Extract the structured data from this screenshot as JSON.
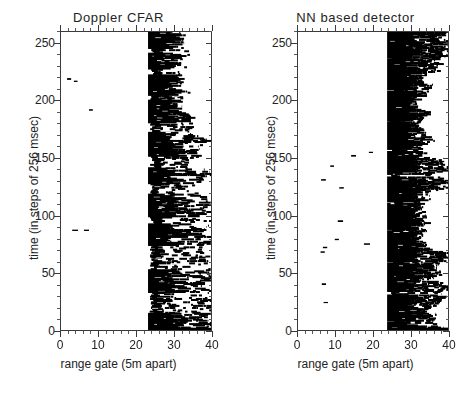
{
  "figure": {
    "background_color": "#ffffff",
    "ink_color": "#000000",
    "axis_color": "#3a3a3a",
    "panel_count": 2
  },
  "chart_data": {
    "type": "heatmap",
    "colormap": "binary (black = detection, white = no detection)",
    "xlabel": "range gate (5m apart)",
    "ylabel": "time (in steps of 256 msec)",
    "xlim": [
      0,
      40
    ],
    "ylim": [
      0,
      260
    ],
    "xticks": [
      0,
      10,
      20,
      30,
      40
    ],
    "xticklabels": [
      "0",
      "10",
      "20",
      "30",
      "40"
    ],
    "x_minor_tick_step": 2,
    "yticks": [
      0,
      50,
      100,
      150,
      200,
      250
    ],
    "yticklabels": [
      "0",
      "50",
      "100",
      "150",
      "200",
      "250"
    ],
    "y_minor_tick_step": 10,
    "grid": false,
    "legend": null,
    "panels": [
      {
        "index": 0,
        "title": "Doppler CFAR",
        "clutter_onset_gate": 23.2,
        "clutter_fill_fraction": 0.55,
        "clutter_texture": "striated horizontal streaks with ragged right edge",
        "false_alarm_count": 4,
        "false_alarms": [
          {
            "range_gate": 1.6,
            "time": 219,
            "width_gates": 1.1
          },
          {
            "range_gate": 3.4,
            "time": 217,
            "width_gates": 1.0
          },
          {
            "range_gate": 7.5,
            "time": 192,
            "width_gates": 1.0
          },
          {
            "range_gate": 3.0,
            "time": 87,
            "width_gates": 1.6
          },
          {
            "range_gate": 6.1,
            "time": 87,
            "width_gates": 1.4
          }
        ],
        "dense_time_bands": [
          [
            246,
            261
          ],
          [
            228,
            241
          ],
          [
            205,
            222
          ],
          [
            181,
            200
          ],
          [
            152,
            172
          ],
          [
            128,
            141
          ],
          [
            99,
            118
          ],
          [
            74,
            92
          ],
          [
            33,
            52
          ],
          [
            0,
            14
          ]
        ]
      },
      {
        "index": 1,
        "title": "NN based detector",
        "clutter_onset_gate": 23.8,
        "clutter_fill_fraction": 0.8,
        "clutter_texture": "solid contiguous block with ragged right edge",
        "false_alarm_count": 14,
        "false_alarms": [
          {
            "range_gate": 6.2,
            "time": 131,
            "width_gates": 1.2
          },
          {
            "range_gate": 11.0,
            "time": 124,
            "width_gates": 1.2
          },
          {
            "range_gate": 10.6,
            "time": 95,
            "width_gates": 1.4
          },
          {
            "range_gate": 9.8,
            "time": 79,
            "width_gates": 1.1
          },
          {
            "range_gate": 17.6,
            "time": 75,
            "width_gates": 1.6
          },
          {
            "range_gate": 6.6,
            "time": 72,
            "width_gates": 1.2
          },
          {
            "range_gate": 6.0,
            "time": 68,
            "width_gates": 1.1
          },
          {
            "range_gate": 6.3,
            "time": 40,
            "width_gates": 1.2
          },
          {
            "range_gate": 6.8,
            "time": 24,
            "width_gates": 1.2
          },
          {
            "range_gate": 14.2,
            "time": 152,
            "width_gates": 1.3
          },
          {
            "range_gate": 18.9,
            "time": 155,
            "width_gates": 1.1
          },
          {
            "range_gate": 8.6,
            "time": 143,
            "width_gates": 1.0
          },
          {
            "range_gate": 37.5,
            "time": 147,
            "width_gates": 1.5
          },
          {
            "range_gate": 33.0,
            "time": 222,
            "width_gates": 1.4
          }
        ],
        "dense_time_bands": [
          [
            238,
            261
          ],
          [
            210,
            236
          ],
          [
            183,
            208
          ],
          [
            158,
            181
          ],
          [
            136,
            155
          ],
          [
            112,
            133
          ],
          [
            88,
            110
          ],
          [
            60,
            86
          ],
          [
            34,
            58
          ],
          [
            8,
            30
          ],
          [
            0,
            6
          ]
        ]
      }
    ]
  },
  "axes": {
    "ylabel": "time (in steps of 256 msec)",
    "xlabel": "range gate (5m apart)"
  }
}
